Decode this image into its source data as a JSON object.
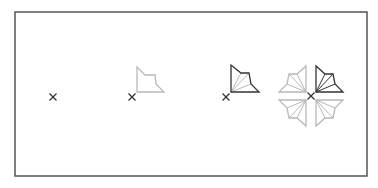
{
  "diagram": {
    "frame": {
      "x": 15,
      "y": 12,
      "w": 352,
      "h": 164,
      "stroke": "#555555"
    },
    "colors": {
      "dark": "#333333",
      "light": "#b8b8b8"
    },
    "steps": [
      {
        "id": "step-1",
        "label": "origin point",
        "marker": {
          "x": 53,
          "y": 97
        }
      },
      {
        "id": "step-2",
        "label": "outline shape",
        "marker": {
          "x": 132,
          "y": 97
        }
      },
      {
        "id": "step-3",
        "label": "outline shape with radial lines",
        "marker": {
          "x": 226,
          "y": 97
        }
      },
      {
        "id": "step-4",
        "label": "four-fold mirrored pattern",
        "center": {
          "x": 311,
          "y": 96
        }
      }
    ]
  }
}
